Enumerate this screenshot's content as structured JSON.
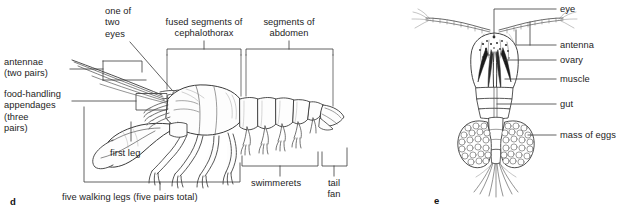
{
  "figure": {
    "background_color": "#ffffff",
    "ink_color": "#1d1d1d",
    "line_color": "#3a3a3a"
  },
  "panels": [
    {
      "letter": "d",
      "subject": "lobster-external-anatomy",
      "labels": [
        {
          "id": "antennae",
          "text": "antennae\n(two pairs)"
        },
        {
          "id": "food-handling",
          "text": "food-handling\nappendages\n(three\npairs)"
        },
        {
          "id": "one-of-two-eyes",
          "text": "one of\ntwo\neyes"
        },
        {
          "id": "cephalothorax",
          "text": "fused segments of\ncephalothorax"
        },
        {
          "id": "abdomen",
          "text": "segments of\nabdomen"
        },
        {
          "id": "first-leg",
          "text": "first leg"
        },
        {
          "id": "walking-legs",
          "text": "five walking legs (five pairs total)"
        },
        {
          "id": "swimmerets",
          "text": "swimmerets"
        },
        {
          "id": "tail-fan",
          "text": "tail\nfan"
        }
      ]
    },
    {
      "letter": "e",
      "subject": "copepod-internal-anatomy",
      "labels": [
        {
          "id": "eye",
          "text": "eye"
        },
        {
          "id": "antenna",
          "text": "antenna"
        },
        {
          "id": "ovary",
          "text": "ovary"
        },
        {
          "id": "muscle",
          "text": "muscle"
        },
        {
          "id": "gut",
          "text": "gut"
        },
        {
          "id": "mass-of-eggs",
          "text": "mass of eggs"
        }
      ]
    }
  ]
}
